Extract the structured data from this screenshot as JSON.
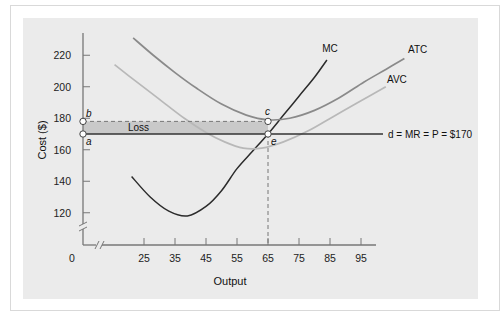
{
  "chart_data": {
    "type": "line",
    "title": "",
    "xlabel": "Output",
    "ylabel": "Cost ($)",
    "xlim": [
      0,
      100
    ],
    "ylim": [
      0,
      230
    ],
    "x_ticks": [
      25,
      35,
      45,
      55,
      65,
      75,
      85,
      95
    ],
    "y_ticks": [
      120,
      140,
      160,
      180,
      200,
      220
    ],
    "origin_label": "0",
    "axis_breaks": true,
    "grid": false,
    "series": [
      {
        "name": "MC",
        "color": "#2b2b2b",
        "points": [
          [
            21,
            143
          ],
          [
            27,
            130
          ],
          [
            33,
            121
          ],
          [
            39,
            118
          ],
          [
            45,
            124
          ],
          [
            50,
            134
          ],
          [
            55,
            148
          ],
          [
            60,
            159
          ],
          [
            65,
            170
          ],
          [
            70,
            182
          ],
          [
            75,
            194
          ],
          [
            80,
            206
          ],
          [
            84,
            217
          ]
        ]
      },
      {
        "name": "ATC",
        "color": "#8a8a8a",
        "points": [
          [
            21.5,
            231
          ],
          [
            28,
            220
          ],
          [
            35,
            209
          ],
          [
            42,
            199
          ],
          [
            50,
            189
          ],
          [
            58,
            182
          ],
          [
            65,
            179
          ],
          [
            72,
            180
          ],
          [
            80,
            185
          ],
          [
            88,
            193
          ],
          [
            96,
            203
          ],
          [
            103,
            211
          ],
          [
            109,
            218
          ]
        ]
      },
      {
        "name": "AVC",
        "color": "#b8b8b8",
        "points": [
          [
            15.5,
            214
          ],
          [
            22,
            204
          ],
          [
            30,
            192
          ],
          [
            38,
            180
          ],
          [
            45,
            171
          ],
          [
            51,
            165
          ],
          [
            57,
            161
          ],
          [
            63,
            161
          ],
          [
            70,
            165
          ],
          [
            78,
            172
          ],
          [
            86,
            181
          ],
          [
            94,
            190
          ],
          [
            103,
            200
          ]
        ]
      }
    ],
    "price_line": {
      "label": "d = MR = P = $170",
      "value": 170,
      "x_end": 102
    },
    "loss_area": {
      "label": "Loss",
      "x_from": 0,
      "x_to": 65,
      "y_from": 170,
      "y_to": 178
    },
    "points": [
      {
        "label": "a",
        "x": 0,
        "y": 170
      },
      {
        "label": "b",
        "x": 0,
        "y": 178
      },
      {
        "label": "c",
        "x": 65,
        "y": 178
      },
      {
        "label": "e",
        "x": 65,
        "y": 170
      }
    ],
    "dashed_vertical_x": 65
  }
}
